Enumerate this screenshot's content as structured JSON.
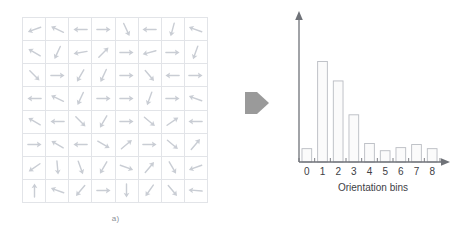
{
  "figure": {
    "panel_a": {
      "caption": "a)",
      "description": "gradient-orientation arrow grid",
      "grid": {
        "rows": 8,
        "cols": 8,
        "cell_line_color": "#e2e4e8",
        "arrow_color": "#c9cdd4",
        "angles_deg": [
          [
            200,
            155,
            180,
            0,
            295,
            180,
            255,
            160
          ],
          [
            150,
            245,
            190,
            45,
            0,
            195,
            0,
            250
          ],
          [
            315,
            0,
            240,
            245,
            0,
            310,
            180,
            0
          ],
          [
            180,
            155,
            245,
            0,
            0,
            250,
            0,
            160
          ],
          [
            150,
            180,
            315,
            240,
            0,
            320,
            35,
            180
          ],
          [
            0,
            150,
            180,
            330,
            40,
            0,
            320,
            50
          ],
          [
            215,
            275,
            290,
            240,
            340,
            50,
            300,
            200
          ],
          [
            90,
            160,
            230,
            0,
            270,
            235,
            310,
            175
          ]
        ]
      }
    },
    "transition": {
      "icon": "chevron-right-icon",
      "color": "#9a9a9a"
    },
    "panel_b": {
      "caption": "b)"
    }
  },
  "chart_data": {
    "type": "bar",
    "title": "",
    "xlabel": "Orientation bins",
    "ylabel": "",
    "categories": [
      "0",
      "1",
      "2",
      "3",
      "4",
      "5",
      "6",
      "7",
      "8"
    ],
    "values": [
      13,
      98,
      79,
      46,
      18,
      11,
      14,
      17,
      13
    ],
    "ylim": [
      0,
      115
    ],
    "grid": false,
    "legend": null,
    "axis_color": "#6f7278",
    "bar_fill": "#fbfbfb",
    "bar_stroke": "#b9bcc2"
  }
}
